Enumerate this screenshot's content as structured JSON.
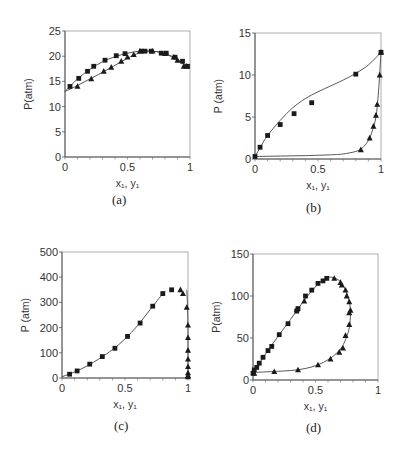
{
  "chart_data": [
    {
      "id": "a",
      "caption": "(a)",
      "type": "scatter",
      "xlabel": "x₁, y₁",
      "ylabel": "P(atm)",
      "xlim": [
        0,
        1
      ],
      "ylim": [
        0,
        25
      ],
      "xticks": [
        "0",
        "0.5",
        "1"
      ],
      "xtick_values": [
        0,
        0.5,
        1
      ],
      "yticks": [
        "0",
        "5",
        "10",
        "15",
        "20",
        "25"
      ],
      "ytick_values": [
        0,
        5,
        10,
        15,
        20,
        25
      ],
      "grid": false,
      "frame": {
        "left": 65,
        "right": 190,
        "top": 31,
        "bottom": 157
      },
      "series": [
        {
          "name": "liquid (x1)",
          "marker": "square",
          "x": [
            0.04,
            0.11,
            0.18,
            0.23,
            0.32,
            0.41,
            0.48,
            0.61,
            0.64,
            0.69,
            0.77,
            0.81,
            0.88,
            0.94,
            0.98
          ],
          "y": [
            14,
            15.6,
            17,
            18,
            19.2,
            20.1,
            20.5,
            21,
            21,
            21,
            20.6,
            20.6,
            19.8,
            19,
            18
          ]
        },
        {
          "name": "vapor (y1)",
          "marker": "triangle",
          "x": [
            0.1,
            0.21,
            0.31,
            0.37,
            0.45,
            0.5,
            0.55,
            0.6,
            0.7,
            0.8,
            0.87,
            0.9,
            0.95,
            0.97
          ],
          "y": [
            14,
            15.5,
            17,
            17.8,
            19,
            19.8,
            20.3,
            21,
            21,
            20.5,
            19.8,
            19.2,
            18,
            18
          ]
        }
      ],
      "curves": [
        {
          "name": "bubble curve",
          "x": [
            0,
            0.1,
            0.2,
            0.3,
            0.4,
            0.5,
            0.6,
            0.7,
            0.8,
            0.9,
            1.0
          ],
          "y": [
            13,
            15.5,
            17.4,
            18.9,
            19.9,
            20.6,
            21,
            21,
            20.5,
            19.4,
            17.5
          ]
        },
        {
          "name": "dew curve",
          "x": [
            0,
            0.1,
            0.2,
            0.3,
            0.4,
            0.5,
            0.6,
            0.7,
            0.8,
            0.9,
            1.0
          ],
          "y": [
            13,
            14.2,
            15.5,
            16.8,
            18.2,
            19.6,
            20.7,
            21,
            20.5,
            19.2,
            17.5
          ]
        }
      ]
    },
    {
      "id": "b",
      "caption": "(b)",
      "type": "scatter",
      "xlabel": "x₁, y₁",
      "ylabel": "P (atm)",
      "xlim": [
        0,
        1
      ],
      "ylim": [
        0,
        15
      ],
      "xticks": [
        "0",
        "0.5",
        "1"
      ],
      "xtick_values": [
        0,
        0.5,
        1
      ],
      "yticks": [
        "0",
        "5",
        "10",
        "15"
      ],
      "ytick_values": [
        0,
        5,
        10,
        15
      ],
      "grid": false,
      "frame": {
        "left": 255,
        "right": 381,
        "top": 33,
        "bottom": 159
      },
      "series": [
        {
          "name": "liquid (x1)",
          "marker": "square",
          "x": [
            0,
            0.04,
            0.1,
            0.2,
            0.31,
            0.45,
            0.8,
            1.0
          ],
          "y": [
            0.3,
            1.4,
            2.8,
            4.1,
            5.4,
            6.7,
            10.1,
            12.7
          ]
        },
        {
          "name": "vapor (y1)",
          "marker": "triangle",
          "x": [
            0.84,
            0.91,
            0.94,
            0.96,
            0.97,
            0.99,
            1.0
          ],
          "y": [
            1.1,
            2.5,
            3.9,
            5.2,
            6.5,
            10,
            12.7
          ]
        }
      ],
      "curves": [
        {
          "name": "bubble curve",
          "x": [
            0,
            0.05,
            0.1,
            0.2,
            0.3,
            0.4,
            0.5,
            0.6,
            0.7,
            0.8,
            0.9,
            1.0
          ],
          "y": [
            0.3,
            1.6,
            2.8,
            4.6,
            6.1,
            7.2,
            8.0,
            8.7,
            9.4,
            10.2,
            11.2,
            12.7
          ]
        },
        {
          "name": "dew curve",
          "x": [
            0,
            0.2,
            0.4,
            0.6,
            0.7,
            0.8,
            0.85,
            0.9,
            0.93,
            0.96,
            0.98,
            1.0
          ],
          "y": [
            0.3,
            0.35,
            0.4,
            0.5,
            0.6,
            0.9,
            1.3,
            2.2,
            3.3,
            5.0,
            8.0,
            12.7
          ]
        }
      ]
    },
    {
      "id": "c",
      "caption": "(c)",
      "type": "scatter",
      "xlabel": "x₁, y₁",
      "ylabel": "P (atm)",
      "xlim": [
        0,
        1
      ],
      "ylim": [
        0,
        500
      ],
      "xticks": [
        "0",
        "0.5",
        "1"
      ],
      "xtick_values": [
        0,
        0.5,
        1
      ],
      "yticks": [
        "0",
        "100",
        "200",
        "300",
        "400",
        "500"
      ],
      "ytick_values": [
        0,
        100,
        200,
        300,
        400,
        500
      ],
      "grid": false,
      "frame": {
        "left": 62,
        "right": 188,
        "top": 252,
        "bottom": 378
      },
      "series": [
        {
          "name": "liquid (x1)",
          "marker": "square",
          "x": [
            0.06,
            0.12,
            0.22,
            0.32,
            0.42,
            0.52,
            0.62,
            0.72,
            0.8,
            0.87
          ],
          "y": [
            15,
            28,
            55,
            85,
            118,
            165,
            218,
            285,
            335,
            350
          ]
        },
        {
          "name": "vapor (y1)",
          "marker": "triangle",
          "x": [
            0.94,
            0.96,
            0.99,
            1.0,
            1.0,
            1.0,
            1.0,
            1.0,
            1.0,
            1.0,
            1.0
          ],
          "y": [
            350,
            335,
            280,
            210,
            160,
            110,
            75,
            45,
            20,
            10,
            5
          ]
        }
      ],
      "curves": [
        {
          "name": "bubble curve",
          "x": [
            0,
            0.1,
            0.2,
            0.3,
            0.4,
            0.5,
            0.6,
            0.7,
            0.8,
            0.82
          ],
          "y": [
            5,
            24,
            48,
            78,
            112,
            155,
            208,
            272,
            335,
            345
          ]
        },
        {
          "name": "dew curve",
          "x": [
            0.99,
            0.995,
            1.0,
            1.0,
            1.0
          ],
          "y": [
            350,
            300,
            200,
            100,
            0
          ]
        }
      ]
    },
    {
      "id": "d",
      "caption": "(d)",
      "type": "scatter",
      "xlabel": "x₁, y₁",
      "ylabel": "P(atm)",
      "xlim": [
        0,
        1
      ],
      "ylim": [
        0,
        150
      ],
      "xticks": [
        "0",
        "0.5",
        "1"
      ],
      "xtick_values": [
        0,
        0.5,
        1
      ],
      "yticks": [
        "0",
        "50",
        "100",
        "150"
      ],
      "ytick_values": [
        0,
        50,
        100,
        150
      ],
      "grid": false,
      "frame": {
        "left": 253,
        "right": 378,
        "top": 254,
        "bottom": 380
      },
      "series": [
        {
          "name": "liquid (x1)",
          "marker": "square",
          "x": [
            0,
            0.01,
            0.03,
            0.05,
            0.08,
            0.12,
            0.15,
            0.21,
            0.28,
            0.35,
            0.36,
            0.42,
            0.47,
            0.52,
            0.56,
            0.59
          ],
          "y": [
            8,
            12,
            15,
            20,
            27,
            35,
            40,
            54,
            67,
            82,
            85,
            100,
            107,
            115,
            118,
            121
          ]
        },
        {
          "name": "vapor (y1)",
          "marker": "triangle",
          "x": [
            0.01,
            0.17,
            0.36,
            0.52,
            0.62,
            0.69,
            0.72,
            0.74,
            0.77,
            0.77,
            0.78,
            0.77,
            0.75,
            0.74,
            0.71,
            0.7,
            0.65,
            0.35,
            0.41
          ],
          "y": [
            8,
            10,
            12,
            18,
            25,
            33,
            38,
            53,
            66,
            80,
            83,
            93,
            100,
            107,
            113,
            116,
            121,
            84,
            94
          ]
        }
      ],
      "curves": [
        {
          "name": "phase envelope",
          "x": [
            0,
            0.1,
            0.2,
            0.3,
            0.4,
            0.5,
            0.58,
            0.64,
            0.7,
            0.74,
            0.77,
            0.78,
            0.77,
            0.74,
            0.7,
            0.62,
            0.5,
            0.35,
            0.15,
            0
          ],
          "y": [
            8,
            31,
            52,
            72,
            93,
            111,
            121,
            122,
            117,
            107,
            93,
            80,
            62,
            48,
            37,
            26,
            17,
            12,
            10,
            9
          ]
        }
      ]
    }
  ]
}
